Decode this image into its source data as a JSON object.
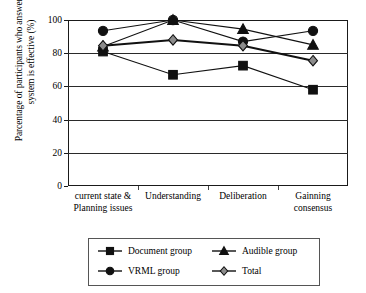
{
  "chart_data": {
    "type": "line",
    "title": "",
    "xlabel": "",
    "ylabel": "Parcentage of participants who answer this system is effective (%)",
    "ylim": [
      0,
      100
    ],
    "yticks": [
      0,
      20,
      40,
      60,
      80,
      100
    ],
    "grid": true,
    "legend_position": "bottom",
    "categories": [
      "current state & Planning issues",
      "Understanding",
      "Deliberation",
      "Gainning consensus"
    ],
    "category_lines": [
      [
        "current state &",
        "Planning issues"
      ],
      [
        "Understanding",
        ""
      ],
      [
        "Deliberation",
        ""
      ],
      [
        "Gainning",
        "consensus"
      ]
    ],
    "series": [
      {
        "name": "Document group",
        "marker": "square",
        "marker_fill": "#111111",
        "line_color": "#111111",
        "values": [
          81,
          67,
          72.5,
          58
        ]
      },
      {
        "name": "Audible group",
        "marker": "triangle",
        "marker_fill": "#111111",
        "line_color": "#111111",
        "values": [
          84,
          100,
          94.5,
          85
        ]
      },
      {
        "name": "VRML group",
        "marker": "circle",
        "marker_fill": "#111111",
        "line_color": "#111111",
        "values": [
          93.5,
          100,
          87,
          93.5
        ]
      },
      {
        "name": "Total",
        "marker": "diamond",
        "marker_fill": "#8c8c8c",
        "line_color": "#111111",
        "values": [
          84.5,
          88,
          84.5,
          75.5
        ]
      }
    ]
  },
  "axis": {
    "ytick_labels": [
      "100",
      "80",
      "60",
      "40",
      "20",
      "0"
    ]
  },
  "legend": {
    "items": [
      {
        "label": "Document group",
        "marker": "square"
      },
      {
        "label": "Audible group",
        "marker": "triangle"
      },
      {
        "label": "VRML group",
        "marker": "circle"
      },
      {
        "label": "Total",
        "marker": "diamond"
      }
    ]
  }
}
